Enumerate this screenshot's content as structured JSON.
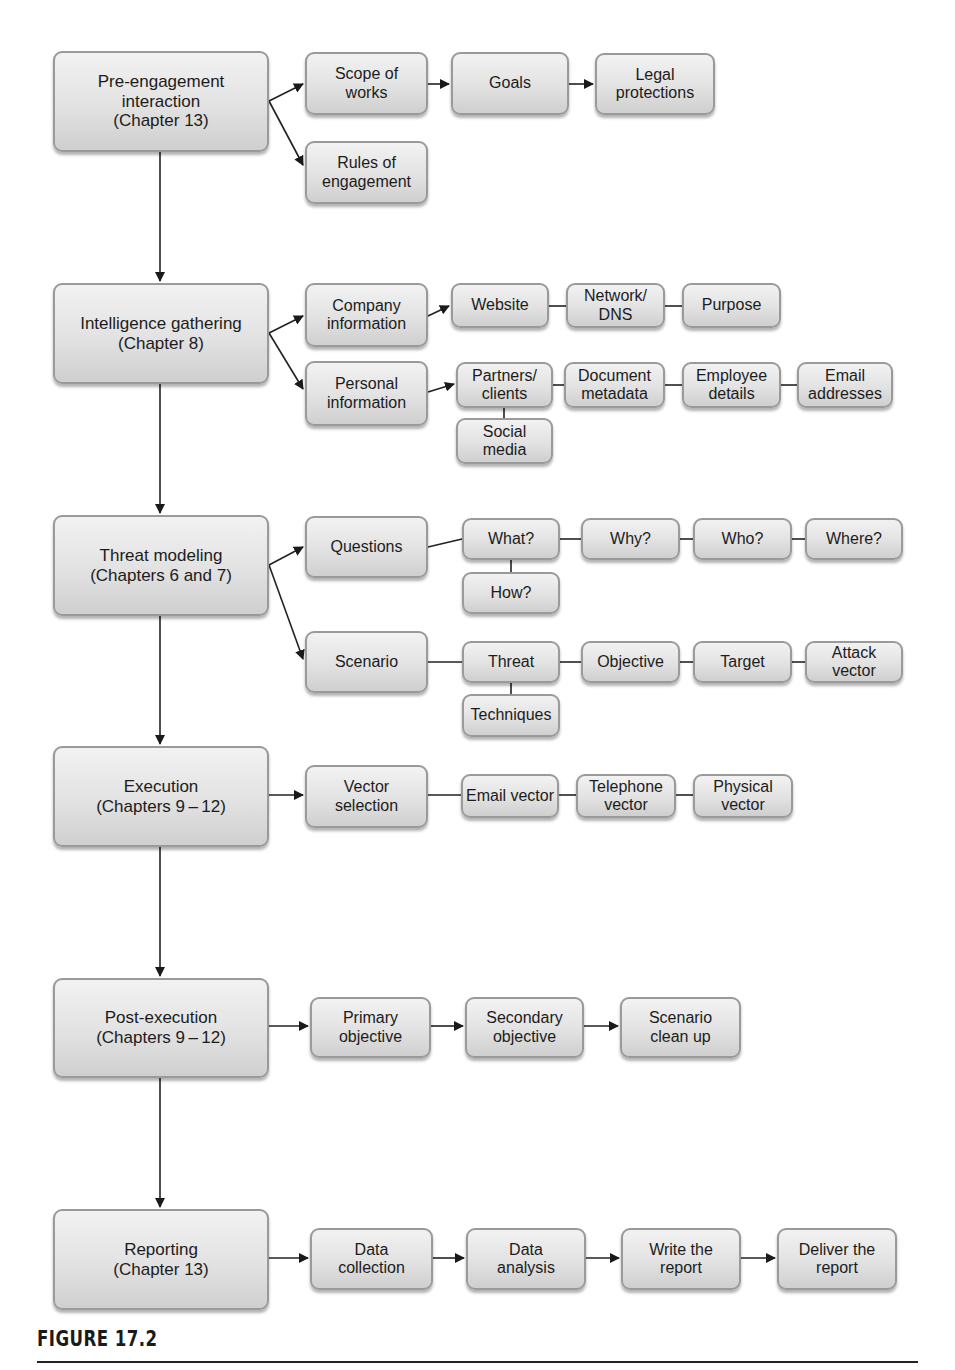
{
  "figure": {
    "caption": "FIGURE 17.2",
    "colors": {
      "box_fill": "#e2e2e2",
      "box_border": "#9a9a9a",
      "line": "#222222",
      "text": "#1c1c1c"
    }
  },
  "phases": [
    {
      "id": "pre",
      "label": "Pre-engagement\ninteraction\n(Chapter 13)",
      "children": [
        {
          "id": "scope",
          "label": "Scope of\nworks"
        },
        {
          "id": "goals",
          "label": "Goals"
        },
        {
          "id": "legal",
          "label": "Legal\nprotections"
        },
        {
          "id": "rules",
          "label": "Rules of\nengagement"
        }
      ]
    },
    {
      "id": "intel",
      "label": "Intelligence gathering\n(Chapter 8)",
      "children": [
        {
          "id": "company",
          "label": "Company\ninformation"
        },
        {
          "id": "website",
          "label": "Website"
        },
        {
          "id": "network",
          "label": "Network/\nDNS"
        },
        {
          "id": "purpose",
          "label": "Purpose"
        },
        {
          "id": "personal",
          "label": "Personal\ninformation"
        },
        {
          "id": "partners",
          "label": "Partners/\nclients"
        },
        {
          "id": "docmeta",
          "label": "Document\nmetadata"
        },
        {
          "id": "employee",
          "label": "Employee\ndetails"
        },
        {
          "id": "email",
          "label": "Email\naddresses"
        },
        {
          "id": "social",
          "label": "Social\nmedia"
        }
      ]
    },
    {
      "id": "threat",
      "label": "Threat modeling\n(Chapters 6 and 7)",
      "children": [
        {
          "id": "questions",
          "label": "Questions"
        },
        {
          "id": "what",
          "label": "What?"
        },
        {
          "id": "why",
          "label": "Why?"
        },
        {
          "id": "who",
          "label": "Who?"
        },
        {
          "id": "where",
          "label": "Where?"
        },
        {
          "id": "how",
          "label": "How?"
        },
        {
          "id": "scenario",
          "label": "Scenario"
        },
        {
          "id": "threatnode",
          "label": "Threat"
        },
        {
          "id": "objective",
          "label": "Objective"
        },
        {
          "id": "target",
          "label": "Target"
        },
        {
          "id": "attack",
          "label": "Attack\nvector"
        },
        {
          "id": "techniques",
          "label": "Techniques"
        }
      ]
    },
    {
      "id": "exec",
      "label": "Execution\n(Chapters 9 – 12)",
      "children": [
        {
          "id": "vector",
          "label": "Vector\nselection"
        },
        {
          "id": "emailvec",
          "label": "Email vector"
        },
        {
          "id": "phonevec",
          "label": "Telephone\nvector"
        },
        {
          "id": "physvec",
          "label": "Physical\nvector"
        }
      ]
    },
    {
      "id": "post",
      "label": "Post-execution\n(Chapters 9 – 12)",
      "children": [
        {
          "id": "primary",
          "label": "Primary\nobjective"
        },
        {
          "id": "secondary",
          "label": "Secondary\nobjective"
        },
        {
          "id": "cleanup",
          "label": "Scenario\nclean up"
        }
      ]
    },
    {
      "id": "report",
      "label": "Reporting\n(Chapter 13)",
      "children": [
        {
          "id": "datacol",
          "label": "Data\ncollection"
        },
        {
          "id": "dataana",
          "label": "Data\nanalysis"
        },
        {
          "id": "write",
          "label": "Write the\nreport"
        },
        {
          "id": "deliver",
          "label": "Deliver the\nreport"
        }
      ]
    }
  ]
}
